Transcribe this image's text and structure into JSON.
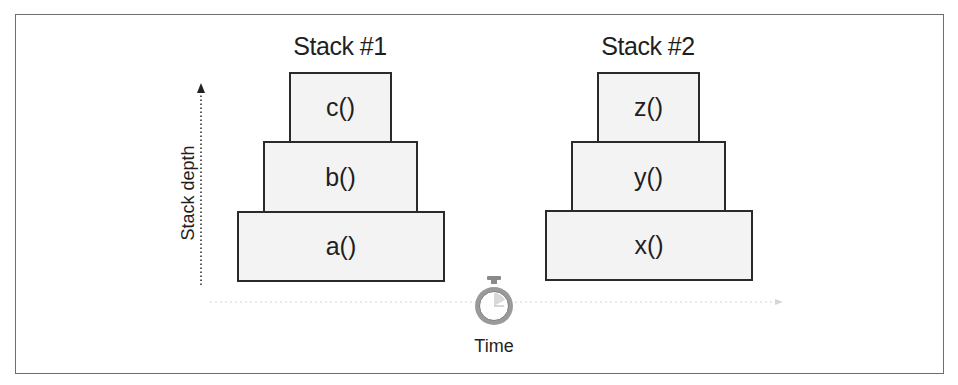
{
  "diagram": {
    "stacks": [
      {
        "title": "Stack #1",
        "frames_bottom_to_top": [
          "a()",
          "b()",
          "c()"
        ]
      },
      {
        "title": "Stack #2",
        "frames_bottom_to_top": [
          "x()",
          "y()",
          "z()"
        ]
      }
    ],
    "y_axis": {
      "label": "Stack depth",
      "direction": "up",
      "style": "dotted arrow"
    },
    "x_axis": {
      "label": "Time",
      "icon": "stopwatch-icon",
      "style": "faint dotted line"
    },
    "colors": {
      "box_fill": "#f3f3f3",
      "box_border": "#2a2a2a",
      "frame_border": "#6e6e6e",
      "stopwatch": "#8a8a8a"
    }
  }
}
